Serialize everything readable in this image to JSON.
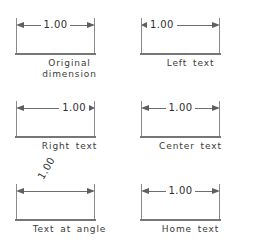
{
  "figure": {
    "dimension_value": "1.00",
    "line_color": "#6e6e6e",
    "baseline_color": "#767676",
    "text_color": "#2e2e2e",
    "background": "#ffffff"
  },
  "panels": [
    {
      "id": "original-dimension",
      "caption_line1": "Original",
      "caption_line2": "dimension",
      "value": "1.00",
      "text_placement": "centered",
      "text_rotation": 0
    },
    {
      "id": "left-text",
      "caption_line1": "Left text",
      "caption_line2": "",
      "value": "1.00",
      "text_placement": "left",
      "text_rotation": 0
    },
    {
      "id": "right-text",
      "caption_line1": "Right text",
      "caption_line2": "",
      "value": "1.00",
      "text_placement": "right",
      "text_rotation": 0
    },
    {
      "id": "center-text",
      "caption_line1": "Center text",
      "caption_line2": "",
      "value": "1.00",
      "text_placement": "center",
      "text_rotation": 0
    },
    {
      "id": "text-at-angle",
      "caption_line1": "Text at angle",
      "caption_line2": "",
      "value": "1.00",
      "text_placement": "angled",
      "text_rotation": -60
    },
    {
      "id": "home-text",
      "caption_line1": "Home text",
      "caption_line2": "",
      "value": "1.00",
      "text_placement": "home",
      "text_rotation": 0
    }
  ]
}
